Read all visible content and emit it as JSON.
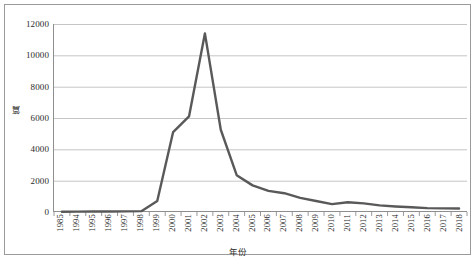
{
  "chart_data": {
    "type": "line",
    "title": "",
    "xlabel": "年份",
    "ylabel": "篇",
    "ylim": [
      0,
      12000
    ],
    "ytick_labels": [
      "12000",
      "10000",
      "8000",
      "6000",
      "4000",
      "2000",
      "0"
    ],
    "ytick_values": [
      12000,
      10000,
      8000,
      6000,
      4000,
      2000,
      0
    ],
    "grid": "horizontal",
    "legend": "none",
    "categories": [
      "1985",
      "1994",
      "1995",
      "1996",
      "1997",
      "1998",
      "1999",
      "2000",
      "2001",
      "2002",
      "2003",
      "2004",
      "2005",
      "2006",
      "2007",
      "2008",
      "2009",
      "2010",
      "2011",
      "2012",
      "2013",
      "2014",
      "2015",
      "2016",
      "2017",
      "2018"
    ],
    "values": [
      20,
      25,
      30,
      35,
      40,
      55,
      700,
      5100,
      6100,
      11400,
      5250,
      2350,
      1700,
      1350,
      1200,
      900,
      700,
      500,
      620,
      550,
      420,
      350,
      300,
      250,
      230,
      220
    ],
    "series_color": "#595959"
  },
  "colors": {
    "frame": "#9a9a9a",
    "gridline": "#b6b6b6",
    "axis": "#8e8e8e",
    "line": "#595959",
    "text": "#2b2b2b",
    "background": "#ffffff"
  }
}
